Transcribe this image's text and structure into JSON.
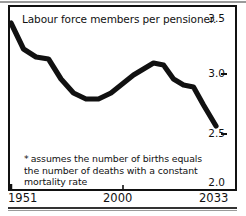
{
  "chart_data": {
    "type": "line",
    "title": "Labour force members per pensioner.",
    "xlabel": "",
    "ylabel": "",
    "xlim": [
      1951,
      2033
    ],
    "ylim": [
      2.0,
      3.5
    ],
    "grid": false,
    "legend": "none",
    "x_ticks": [
      "1951",
      "2000",
      "2033"
    ],
    "x_tick_values": [
      1951,
      2000,
      2033
    ],
    "y_ticks": [
      "3.5",
      "3.0",
      "2.5",
      "2.0"
    ],
    "y_tick_values": [
      3.5,
      3.0,
      2.5,
      2.0
    ],
    "annotation": "* assumes the number of births equals the number of deaths with a constant mortality rate",
    "series": [
      {
        "name": "Labour force members per pensioner",
        "x": [
          1951,
          1956,
          1961,
          1966,
          1971,
          1976,
          1981,
          1986,
          1991,
          1996,
          2000,
          2004,
          2008,
          2012,
          2016,
          2020,
          2024,
          2028,
          2033
        ],
        "values": [
          3.48,
          3.22,
          3.14,
          3.12,
          2.92,
          2.78,
          2.72,
          2.72,
          2.78,
          2.88,
          2.96,
          3.02,
          3.08,
          3.06,
          2.92,
          2.86,
          2.84,
          2.66,
          2.45
        ]
      }
    ]
  },
  "chart": {
    "title": "Labour force members per pensioner.",
    "footnote_marker": "*",
    "footnote_text": "assumes the number of births equals the number of deaths with a constant mortality rate",
    "colors": {
      "line": "#111111",
      "frame": "#111111",
      "background": "#ffffff",
      "rule": "#9a9a9a"
    }
  }
}
